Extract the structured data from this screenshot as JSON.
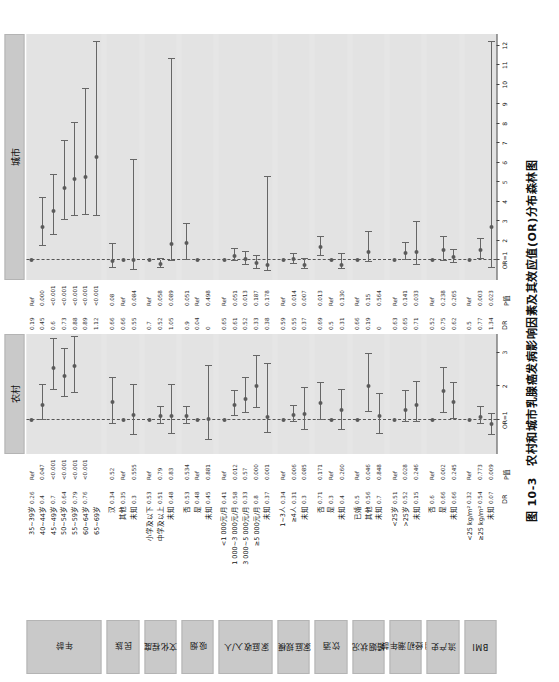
{
  "figure": {
    "caption_number": "图 10-3",
    "caption_text": "农村和城市乳腺癌发病影响因素及其效应值(OR)分布森林图",
    "null_label": "OR=1",
    "col_head_dr": "DR",
    "col_head_p": "P值"
  },
  "panels": [
    {
      "key": "rural",
      "title": "农村",
      "xmin": 0.0,
      "xmax": 3.55,
      "ticks": [
        1,
        2,
        3
      ],
      "tick_labels": [
        "OR=1",
        "2",
        "3"
      ]
    },
    {
      "key": "urban",
      "title": "城市",
      "xmin": 0.0,
      "xmax": 12.6,
      "ticks": [
        1,
        2,
        3,
        4,
        5,
        6,
        7,
        8,
        9,
        10,
        11,
        12
      ],
      "tick_labels": [
        "OR=1",
        "2",
        "3",
        "4",
        "5",
        "6",
        "7",
        "8",
        "9",
        "10",
        "11",
        "12"
      ]
    }
  ],
  "groups": [
    {
      "label": "年龄",
      "n": 7
    },
    {
      "label": "民族",
      "n": 3
    },
    {
      "label": "文化程度",
      "n": 3
    },
    {
      "label": "吸烟",
      "n": 3
    },
    {
      "label": "家庭收入/人",
      "n": 5
    },
    {
      "label": "家庭规模",
      "n": 3
    },
    {
      "label": "饮酒",
      "n": 3
    },
    {
      "label": "婚姻状况",
      "n": 3
    },
    {
      "label": "月经初潮年龄",
      "n": 3
    },
    {
      "label": "流产史",
      "n": 3
    },
    {
      "label": "BMI",
      "n": 3
    }
  ],
  "chart_data": {
    "type": "forest",
    "title": "农村和城市乳腺癌发病影响因素及其效应值(OR)分布森林图",
    "xlabel": "OR",
    "ylabel": "",
    "grid": false,
    "legend": "none",
    "reference_line": 1,
    "panels": [
      "农村",
      "城市"
    ],
    "xlim_rural": [
      0.0,
      3.55
    ],
    "xlim_urban": [
      0.0,
      12.6
    ],
    "rows": [
      {
        "group": "年龄",
        "label": "35~39岁",
        "rural": {
          "dr": "0.26",
          "p": "Ref",
          "or": 1.0,
          "lo": null,
          "hi": null,
          "ref": true
        },
        "urban": {
          "dr": "0.19",
          "p": "Ref",
          "or": 1.0,
          "lo": null,
          "hi": null,
          "ref": true
        }
      },
      {
        "group": "年龄",
        "label": "40~44岁",
        "rural": {
          "dr": "0.4",
          "p": "0.047",
          "or": 1.45,
          "lo": 1.02,
          "hi": 2.05
        },
        "urban": {
          "dr": "0.45",
          "p": "0.000",
          "or": 2.7,
          "lo": 1.75,
          "hi": 4.2
        }
      },
      {
        "group": "年龄",
        "label": "45~49岁",
        "rural": {
          "dr": "0.7",
          "p": "<0.001",
          "or": 2.55,
          "lo": 1.88,
          "hi": 3.4
        },
        "urban": {
          "dr": "0.6",
          "p": "<0.001",
          "or": 3.55,
          "lo": 2.3,
          "hi": 5.4
        }
      },
      {
        "group": "年龄",
        "label": "50~54岁",
        "rural": {
          "dr": "0.64",
          "p": "<0.001",
          "or": 2.3,
          "lo": 1.7,
          "hi": 3.1
        },
        "urban": {
          "dr": "0.73",
          "p": "<0.001",
          "or": 4.7,
          "lo": 3.05,
          "hi": 7.1
        }
      },
      {
        "group": "年龄",
        "label": "55~59岁",
        "rural": {
          "dr": "0.79",
          "p": "<0.001",
          "or": 2.6,
          "lo": 1.8,
          "hi": 3.45
        },
        "urban": {
          "dr": "0.88",
          "p": "<0.001",
          "or": 5.15,
          "lo": 3.3,
          "hi": 8.05
        }
      },
      {
        "group": "年龄",
        "label": "60~64岁",
        "rural": {
          "dr": "0.76",
          "p": "<0.001",
          "or": null,
          "lo": null,
          "hi": null
        },
        "urban": {
          "dr": "0.89",
          "p": "<0.001",
          "or": 5.3,
          "lo": 3.35,
          "hi": 9.8
        }
      },
      {
        "group": "年龄",
        "label": "65~69岁",
        "rural": {
          "dr": "",
          "p": "",
          "or": null,
          "lo": null,
          "hi": null
        },
        "urban": {
          "dr": "1.12",
          "p": "<0.001",
          "or": 6.3,
          "lo": 3.3,
          "hi": 12.2
        }
      },
      {
        "group": "民族",
        "label": "汉",
        "rural": {
          "dr": "0.34",
          "p": "0.52",
          "or": 1.55,
          "lo": 0.9,
          "hi": 2.25
        },
        "urban": {
          "dr": "0.66",
          "p": "0.08",
          "or": 0.96,
          "lo": 0.62,
          "hi": 1.85
        }
      },
      {
        "group": "民族",
        "label": "其他",
        "rural": {
          "dr": "0.35",
          "p": "Ref",
          "or": 1.0,
          "lo": null,
          "hi": null,
          "ref": true
        },
        "urban": {
          "dr": "0.66",
          "p": "Ref",
          "or": 1.0,
          "lo": null,
          "hi": null,
          "ref": true
        }
      },
      {
        "group": "民族",
        "label": "未知",
        "rural": {
          "dr": "0.3",
          "p": "0.555",
          "or": 1.15,
          "lo": 0.55,
          "hi": 2.05
        },
        "urban": {
          "dr": "0.55",
          "p": "0.084",
          "or": 1.0,
          "lo": 0.5,
          "hi": 6.15
        }
      },
      {
        "group": "文化程度",
        "label": "小学及以下",
        "rural": {
          "dr": "0.53",
          "p": "Ref",
          "or": 1.0,
          "lo": null,
          "hi": null,
          "ref": true
        },
        "urban": {
          "dr": "0.7",
          "p": "Ref",
          "or": 1.0,
          "lo": null,
          "hi": null,
          "ref": true
        }
      },
      {
        "group": "文化程度",
        "label": "中学及以上",
        "rural": {
          "dr": "0.51",
          "p": "0.79",
          "or": 1.12,
          "lo": 0.9,
          "hi": 1.4
        },
        "urban": {
          "dr": "0.52",
          "p": "0.058",
          "or": 0.82,
          "lo": 0.62,
          "hi": 1.05
        }
      },
      {
        "group": "文化程度",
        "label": "未知",
        "rural": {
          "dr": "0.48",
          "p": "0.83",
          "or": 1.12,
          "lo": 0.6,
          "hi": 2.05
        },
        "urban": {
          "dr": "1.05",
          "p": "0.089",
          "or": 1.85,
          "lo": 0.95,
          "hi": 11.3
        }
      },
      {
        "group": "吸烟",
        "label": "否",
        "rural": {
          "dr": "0.53",
          "p": "0.534",
          "or": 1.12,
          "lo": 0.9,
          "hi": 1.4
        },
        "urban": {
          "dr": "0.9",
          "p": "0.051",
          "or": 1.9,
          "lo": 1.02,
          "hi": 2.85
        }
      },
      {
        "group": "吸烟",
        "label": "是",
        "rural": {
          "dr": "0.48",
          "p": "Ref",
          "or": 1.0,
          "lo": null,
          "hi": null,
          "ref": true
        },
        "urban": {
          "dr": "0.04",
          "p": "Ref",
          "or": 1.0,
          "lo": null,
          "hi": null,
          "ref": true
        }
      },
      {
        "group": "吸烟",
        "label": "未知",
        "rural": {
          "dr": "0.45",
          "p": "0.881",
          "or": 1.05,
          "lo": 0.4,
          "hi": 2.6
        },
        "urban": {
          "dr": "0",
          "p": "0.498",
          "or": null,
          "lo": null,
          "hi": null
        }
      },
      {
        "group": "家庭收入/人",
        "label": "<1 000元/月",
        "rural": {
          "dr": "0.41",
          "p": "Ref",
          "or": 1.0,
          "lo": null,
          "hi": null,
          "ref": true
        },
        "urban": {
          "dr": "0.65",
          "p": "Ref",
          "or": 1.0,
          "lo": null,
          "hi": null,
          "ref": true
        }
      },
      {
        "group": "家庭收入/人",
        "label": "1 000~3 000元/月",
        "rural": {
          "dr": "0.58",
          "p": "0.012",
          "or": 1.45,
          "lo": 1.12,
          "hi": 1.85
        },
        "urban": {
          "dr": "0.61",
          "p": "0.051",
          "or": 1.22,
          "lo": 0.95,
          "hi": 1.6
        }
      },
      {
        "group": "家庭收入/人",
        "label": "3 000~5 000元/月",
        "rural": {
          "dr": "0.33",
          "p": "0.57",
          "or": 1.62,
          "lo": 1.2,
          "hi": 2.25
        },
        "urban": {
          "dr": "0.52",
          "p": "0.013",
          "or": 1.08,
          "lo": 0.78,
          "hi": 1.45
        }
      },
      {
        "group": "家庭收入/人",
        "label": "≥5 000元/月",
        "rural": {
          "dr": "0.8",
          "p": "0.000",
          "or": 2.0,
          "lo": 1.35,
          "hi": 2.9
        },
        "urban": {
          "dr": "0.33",
          "p": "0.187",
          "or": 0.85,
          "lo": 0.55,
          "hi": 1.22
        }
      },
      {
        "group": "家庭收入/人",
        "label": "未知",
        "rural": {
          "dr": "0.37",
          "p": "0.001",
          "or": 1.1,
          "lo": 0.62,
          "hi": 2.65
        },
        "urban": {
          "dr": "0.38",
          "p": "0.178",
          "or": 0.78,
          "lo": 0.45,
          "hi": 5.3
        }
      },
      {
        "group": "家庭规模",
        "label": "1~3人",
        "rural": {
          "dr": "0.34",
          "p": "Ref",
          "or": 1.0,
          "lo": null,
          "hi": null,
          "ref": true
        },
        "urban": {
          "dr": "0.59",
          "p": "Ref",
          "or": 1.0,
          "lo": null,
          "hi": null,
          "ref": true
        }
      },
      {
        "group": "家庭规模",
        "label": "≥4人",
        "rural": {
          "dr": "0.31",
          "p": "0.006",
          "or": 1.15,
          "lo": 0.95,
          "hi": 1.42
        },
        "urban": {
          "dr": "0.55",
          "p": "0.014",
          "or": 1.05,
          "lo": 0.82,
          "hi": 1.32
        }
      },
      {
        "group": "家庭规模",
        "label": "未知",
        "rural": {
          "dr": "0.3",
          "p": "0.085",
          "or": 1.18,
          "lo": 0.7,
          "hi": 1.95
        },
        "urban": {
          "dr": "0.37",
          "p": "0.007",
          "or": 0.78,
          "lo": 0.55,
          "hi": 1.08
        }
      },
      {
        "group": "饮酒",
        "label": "否",
        "rural": {
          "dr": "0.71",
          "p": "0.171",
          "or": 1.52,
          "lo": 1.0,
          "hi": 2.1
        },
        "urban": {
          "dr": "0.69",
          "p": "0.013",
          "or": 1.68,
          "lo": 1.25,
          "hi": 2.2
        }
      },
      {
        "group": "饮酒",
        "label": "是",
        "rural": {
          "dr": "0.3",
          "p": "Ref",
          "or": 1.0,
          "lo": null,
          "hi": null,
          "ref": true
        },
        "urban": {
          "dr": "0.5",
          "p": "Ref",
          "or": 1.0,
          "lo": null,
          "hi": null,
          "ref": true
        }
      },
      {
        "group": "饮酒",
        "label": "未知",
        "rural": {
          "dr": "0.4",
          "p": "0.260",
          "or": 1.3,
          "lo": 0.72,
          "hi": 1.9
        },
        "urban": {
          "dr": "0.31",
          "p": "0.130",
          "or": 0.78,
          "lo": 0.55,
          "hi": 1.35
        }
      },
      {
        "group": "婚姻状况",
        "label": "已婚",
        "rural": {
          "dr": "0.5",
          "p": "Ref",
          "or": 1.0,
          "lo": null,
          "hi": null,
          "ref": true
        },
        "urban": {
          "dr": "0.66",
          "p": "Ref",
          "or": 1.0,
          "lo": null,
          "hi": null,
          "ref": true
        }
      },
      {
        "group": "婚姻状况",
        "label": "其他",
        "rural": {
          "dr": "0.56",
          "p": "0.046",
          "or": 2.0,
          "lo": 1.25,
          "hi": 2.95
        },
        "urban": {
          "dr": "0.19",
          "p": "0.15",
          "or": 1.45,
          "lo": 0.9,
          "hi": 2.45
        }
      },
      {
        "group": "婚姻状况",
        "label": "未知",
        "rural": {
          "dr": "0.7",
          "p": "0.848",
          "or": 1.12,
          "lo": 0.58,
          "hi": 1.78
        },
        "urban": {
          "dr": "0",
          "p": "0.564",
          "or": null,
          "lo": null,
          "hi": null
        }
      },
      {
        "group": "月经初潮年龄",
        "label": "<25岁",
        "rural": {
          "dr": "0.51",
          "p": "Ref",
          "or": 1.0,
          "lo": null,
          "hi": null,
          "ref": true
        },
        "urban": {
          "dr": "0.63",
          "p": "Ref",
          "or": 1.0,
          "lo": null,
          "hi": null,
          "ref": true
        }
      },
      {
        "group": "月经初潮年龄",
        "label": ">25岁",
        "rural": {
          "dr": "0.52",
          "p": "0.028",
          "or": 1.3,
          "lo": 0.95,
          "hi": 1.85
        },
        "urban": {
          "dr": "0.65",
          "p": "0.141",
          "or": 1.4,
          "lo": 1.0,
          "hi": 1.88
        }
      },
      {
        "group": "月经初潮年龄",
        "label": "未知",
        "rural": {
          "dr": "0.15",
          "p": "0.246",
          "or": 1.45,
          "lo": 0.95,
          "hi": 2.12
        },
        "urban": {
          "dr": "0.71",
          "p": "0.033",
          "or": 1.45,
          "lo": 0.75,
          "hi": 2.95
        }
      },
      {
        "group": "流产史",
        "label": "否",
        "rural": {
          "dr": "0.6",
          "p": "Ref",
          "or": 1.0,
          "lo": null,
          "hi": null,
          "ref": true
        },
        "urban": {
          "dr": "0.52",
          "p": "Ref",
          "or": 1.0,
          "lo": null,
          "hi": null,
          "ref": true
        }
      },
      {
        "group": "流产史",
        "label": "是",
        "rural": {
          "dr": "0.66",
          "p": "0.002",
          "or": 1.85,
          "lo": 1.2,
          "hi": 2.55
        },
        "urban": {
          "dr": "0.75",
          "p": "0.238",
          "or": 1.52,
          "lo": 0.95,
          "hi": 2.22
        }
      },
      {
        "group": "流产史",
        "label": "未知",
        "rural": {
          "dr": "0.66",
          "p": "0.245",
          "or": 1.55,
          "lo": 1.05,
          "hi": 2.1
        },
        "urban": {
          "dr": "0.62",
          "p": "0.265",
          "or": 1.18,
          "lo": 0.88,
          "hi": 1.55
        }
      },
      {
        "group": "BMI",
        "label": "<25 kg/m²",
        "rural": {
          "dr": "0.32",
          "p": "Ref",
          "or": 1.0,
          "lo": null,
          "hi": null,
          "ref": true
        },
        "urban": {
          "dr": "0.5",
          "p": "Ref",
          "or": 1.0,
          "lo": null,
          "hi": null,
          "ref": true
        }
      },
      {
        "group": "BMI",
        "label": "≥25 kg/m²",
        "rural": {
          "dr": "0.54",
          "p": "0.773",
          "or": 1.1,
          "lo": 0.88,
          "hi": 1.38
        },
        "urban": {
          "dr": "0.77",
          "p": "0.003",
          "or": 1.52,
          "lo": 1.1,
          "hi": 2.1
        }
      },
      {
        "group": "BMI",
        "label": "未知",
        "rural": {
          "dr": "0.07",
          "p": "0.009",
          "or": 0.88,
          "lo": 0.55,
          "hi": 1.18
        },
        "urban": {
          "dr": "1.34",
          "p": "0.023",
          "or": 2.7,
          "lo": 0.62,
          "hi": 12.2
        }
      }
    ]
  }
}
